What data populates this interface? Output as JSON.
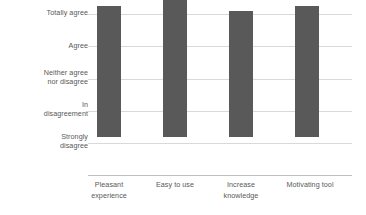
{
  "chart_data": {
    "type": "bar",
    "title": "",
    "subtitle": "",
    "xlabel": "",
    "ylabel": "",
    "categories": [
      "Pleasant experience",
      "Easy to use",
      "Increase knowledge",
      "Motivating tool"
    ],
    "category_lines": [
      [
        "Pleasant",
        "experience"
      ],
      [
        "Easy to use",
        ""
      ],
      [
        "Increase",
        "knowledge"
      ],
      [
        "Motivating tool",
        ""
      ]
    ],
    "y_tick_labels": [
      "Totally agree",
      "Agree",
      "Neither agree nor disagree",
      "In disagreement",
      "Strongly disagree"
    ],
    "y_tick_lines": [
      [
        "Totally agree",
        ""
      ],
      [
        "Agree",
        ""
      ],
      [
        "Neither agree",
        "nor disagree"
      ],
      [
        "In",
        "disagreement"
      ],
      [
        "Strongly",
        "disagree"
      ]
    ],
    "y_scale_values": [
      5,
      4,
      3,
      2,
      1
    ],
    "ylim": [
      0,
      5
    ],
    "grid": true,
    "legend": "none",
    "values": [
      4.05,
      4.38,
      3.88,
      4.05
    ],
    "series": [
      {
        "name": "Response",
        "values": [
          4.05,
          4.38,
          3.88,
          4.05
        ]
      }
    ],
    "bar_color": "#595959",
    "gridline_color": "#D9D9D9",
    "axis_color": "#BFBFBF",
    "text_color": "#595959",
    "background_color": "#FFFFFF"
  }
}
